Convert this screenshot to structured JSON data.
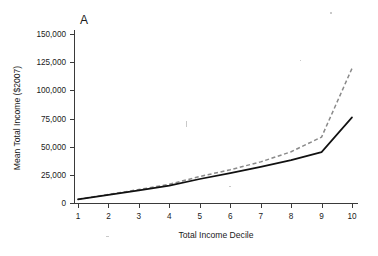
{
  "figure": {
    "panel_label": "A",
    "background_color": "#ffffff"
  },
  "chart_data": {
    "type": "line",
    "title": "",
    "panel_label": "A",
    "xlabel": "Total Income Decile",
    "ylabel": "Mean Total Income ($2007)",
    "x": [
      1,
      2,
      3,
      4,
      5,
      6,
      7,
      8,
      9,
      10
    ],
    "xlim": [
      1,
      10
    ],
    "ylim": [
      0,
      160000
    ],
    "xticks": [
      1,
      2,
      3,
      4,
      5,
      6,
      7,
      8,
      9,
      10
    ],
    "xtick_labels": [
      "1",
      "2",
      "3",
      "4",
      "5",
      "6",
      "7",
      "8",
      "9",
      "10"
    ],
    "yticks": [
      0,
      25000,
      50000,
      75000,
      100000,
      125000,
      150000
    ],
    "ytick_labels": [
      "0",
      "25,000",
      "50,000",
      "75,000",
      "100,000",
      "125,000",
      "150,000"
    ],
    "grid": false,
    "legend": false,
    "legend_position": "none",
    "series": [
      {
        "name": "solid-series",
        "style": "solid",
        "color": "#111111",
        "values": [
          3200,
          7200,
          11200,
          15400,
          21300,
          26500,
          32000,
          38000,
          45200,
          76000
        ]
      },
      {
        "name": "dashed-series",
        "style": "dashed",
        "color": "#8a8a8a",
        "values": [
          3400,
          7600,
          11900,
          16600,
          23500,
          29500,
          36500,
          45500,
          58500,
          119500
        ]
      }
    ]
  },
  "axes": {
    "x_title": "Total Income Decile",
    "y_title": "Mean Total Income ($2007)"
  }
}
